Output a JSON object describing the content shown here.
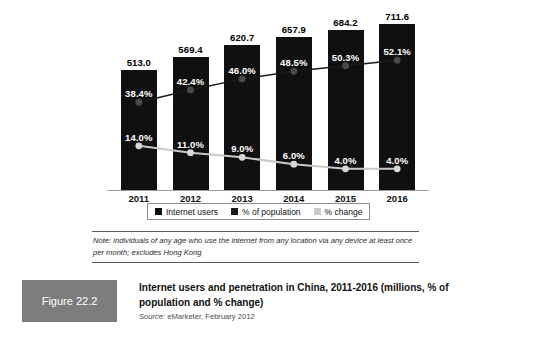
{
  "figure": {
    "tag": "Figure 22.2",
    "title": "Internet users and penetration in China, 2011-2016 (millions, % of population and % change)",
    "source_label": "Source:",
    "source_value": " eMarketer, February 2012",
    "note": "Note: individuals of any age who use the internet from any location via any device at least once per month; excludes Hong Kong"
  },
  "colors": {
    "bar": "#101010",
    "population_line": "#1a1a1a",
    "change_line": "#c9c9c9",
    "axis": "#9a9a9a",
    "tag_background": "#7d7d7d"
  },
  "chart_data": {
    "type": "bar",
    "title": "Internet users and penetration in China, 2011-2016 (millions, % of population and % change)",
    "xlabel": "",
    "ylabel": "",
    "grid": false,
    "legend_position": "bottom",
    "categories": [
      "2011",
      "2012",
      "2013",
      "2014",
      "2015",
      "2016"
    ],
    "ylim": [
      0,
      780
    ],
    "series": [
      {
        "name": "Internet users",
        "type": "bar",
        "unit": "millions",
        "values": [
          513.0,
          569.4,
          620.7,
          657.9,
          684.2,
          711.6
        ],
        "labels": [
          "513.0",
          "569.4",
          "620.7",
          "657.9",
          "684.2",
          "711.6"
        ]
      },
      {
        "name": "% of population",
        "type": "line",
        "unit": "percent",
        "values": [
          38.4,
          42.4,
          46.0,
          48.5,
          50.3,
          52.1
        ],
        "labels": [
          "38.4%",
          "42.4%",
          "46.0%",
          "48.5%",
          "50.3%",
          "52.1%"
        ]
      },
      {
        "name": "% change",
        "type": "line",
        "unit": "percent",
        "values": [
          14.0,
          11.0,
          9.0,
          6.0,
          4.0,
          4.0
        ],
        "labels": [
          "14.0%",
          "11.0%",
          "9.0%",
          "6.0%",
          "4.0%",
          "4.0%"
        ]
      }
    ]
  }
}
